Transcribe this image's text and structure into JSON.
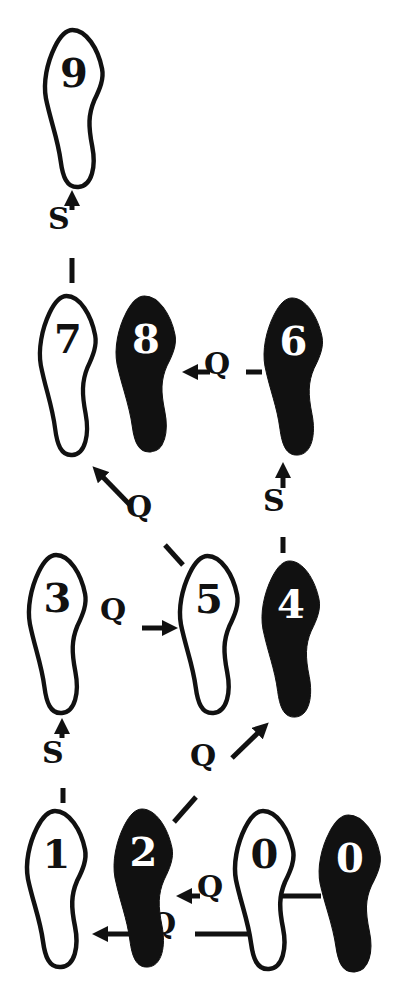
{
  "diagram": {
    "type": "dance-step-footprint-diagram",
    "colors": {
      "ink": "#111111",
      "paper": "#ffffff"
    },
    "footprints": [
      {
        "id": "9",
        "label": "9",
        "fill": "outline",
        "x": 43,
        "y": 27,
        "w": 62,
        "h": 163
      },
      {
        "id": "7",
        "label": "7",
        "fill": "outline",
        "x": 38,
        "y": 293,
        "w": 60,
        "h": 165
      },
      {
        "id": "8",
        "label": "8",
        "fill": "solid",
        "x": 114,
        "y": 293,
        "w": 64,
        "h": 162
      },
      {
        "id": "6",
        "label": "6",
        "fill": "solid",
        "x": 262,
        "y": 295,
        "w": 63,
        "h": 163
      },
      {
        "id": "3",
        "label": "3",
        "fill": "outline",
        "x": 27,
        "y": 552,
        "w": 61,
        "h": 164
      },
      {
        "id": "5",
        "label": "5",
        "fill": "outline",
        "x": 178,
        "y": 553,
        "w": 62,
        "h": 163
      },
      {
        "id": "4",
        "label": "4",
        "fill": "solid",
        "x": 260,
        "y": 558,
        "w": 62,
        "h": 162
      },
      {
        "id": "1",
        "label": "1",
        "fill": "outline",
        "x": 25,
        "y": 808,
        "w": 63,
        "h": 162
      },
      {
        "id": "2",
        "label": "2",
        "fill": "solid",
        "x": 112,
        "y": 806,
        "w": 63,
        "h": 164
      },
      {
        "id": "0L",
        "label": "0",
        "fill": "outline",
        "x": 233,
        "y": 808,
        "w": 63,
        "h": 164
      },
      {
        "id": "0R",
        "label": "0",
        "fill": "solid",
        "x": 317,
        "y": 812,
        "w": 66,
        "h": 163
      }
    ],
    "step_labels": [
      {
        "id": "s-3-9",
        "text": "S",
        "x": 58,
        "y": 220
      },
      {
        "id": "q-6-8",
        "text": "Q",
        "x": 214,
        "y": 365
      },
      {
        "id": "q-5-7",
        "text": "Q",
        "x": 136,
        "y": 508
      },
      {
        "id": "s-4-6",
        "text": "S",
        "x": 273,
        "y": 502
      },
      {
        "id": "q-3-5",
        "text": "Q",
        "x": 110,
        "y": 611
      },
      {
        "id": "s-1-3",
        "text": "S",
        "x": 52,
        "y": 754
      },
      {
        "id": "q-2-4",
        "text": "Q",
        "x": 200,
        "y": 757
      },
      {
        "id": "q-0-2",
        "text": "Q",
        "x": 207,
        "y": 888
      },
      {
        "id": "q-0-1",
        "text": "Q",
        "x": 160,
        "y": 925
      }
    ],
    "sequence": [
      "0",
      "1",
      "2",
      "3",
      "4",
      "5",
      "6",
      "7",
      "8",
      "9"
    ],
    "rhythm": [
      "Q",
      "Q",
      "S",
      "Q",
      "S",
      "Q",
      "Q",
      "Q",
      "S"
    ]
  }
}
